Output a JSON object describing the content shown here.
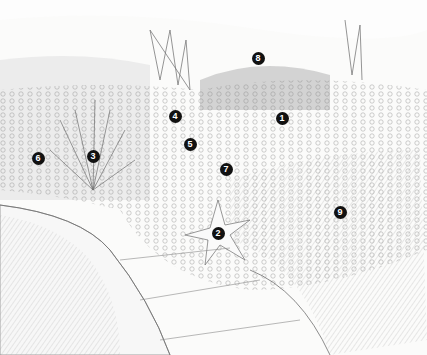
{
  "illustration": {
    "description": "Pencil sketch of a garden border planting with numbered plant markers",
    "colors": {
      "paper": "#fbfbfa",
      "pencil": "#6e6e6e",
      "shade": "#b9b9b9",
      "marker": "#111111"
    },
    "markers": [
      {
        "label": "1",
        "x": 282,
        "y": 118
      },
      {
        "label": "2",
        "x": 218,
        "y": 233
      },
      {
        "label": "3",
        "x": 93,
        "y": 156
      },
      {
        "label": "4",
        "x": 175,
        "y": 116
      },
      {
        "label": "5",
        "x": 190,
        "y": 144
      },
      {
        "label": "6",
        "x": 38,
        "y": 158
      },
      {
        "label": "7",
        "x": 226,
        "y": 169
      },
      {
        "label": "8",
        "x": 258,
        "y": 58
      },
      {
        "label": "9",
        "x": 340,
        "y": 212
      }
    ]
  }
}
